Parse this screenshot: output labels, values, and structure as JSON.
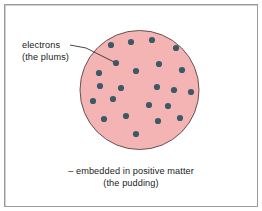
{
  "figure": {
    "background_color": "#ffffff",
    "frame_color": "#9a9a9a"
  },
  "sphere": {
    "name": "positive-matter-sphere",
    "fill_color": "#f4b4b4",
    "stroke_color": "#6b5050",
    "center_x": 139.5,
    "center_y": 90,
    "radius": 59.5
  },
  "electrons": {
    "dot_color": "#3d5866",
    "dot_radius": 3.1,
    "count": 23,
    "positions": [
      [
        111,
        45
      ],
      [
        131,
        42
      ],
      [
        152,
        40
      ],
      [
        176,
        48
      ],
      [
        116,
        63
      ],
      [
        99,
        73
      ],
      [
        136,
        71
      ],
      [
        159,
        64
      ],
      [
        182,
        70
      ],
      [
        121,
        88
      ],
      [
        157,
        87
      ],
      [
        174,
        90
      ],
      [
        191,
        92
      ],
      [
        93,
        101
      ],
      [
        113,
        99
      ],
      [
        149,
        105
      ],
      [
        168,
        106
      ],
      [
        104,
        119
      ],
      [
        126,
        116
      ],
      [
        158,
        121
      ],
      [
        180,
        118
      ],
      [
        136,
        134
      ],
      [
        100,
        86
      ]
    ]
  },
  "leader_line": {
    "name": "electrons-leader-line",
    "color": "#333333",
    "from_x": 70,
    "from_y": 45,
    "bend_x": 86,
    "bend_y": 48,
    "to_x": 114,
    "to_y": 62
  },
  "labels": {
    "electrons": {
      "line1": "electrons",
      "line2": "(the plums)"
    },
    "caption": {
      "line1": "– embedded in positive matter",
      "line2": "(the pudding)"
    }
  }
}
